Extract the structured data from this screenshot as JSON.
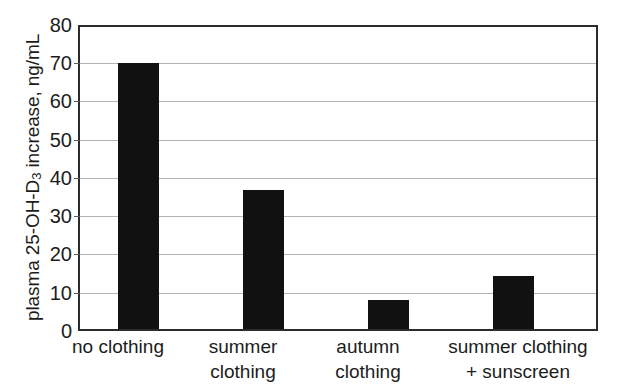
{
  "chart_data": {
    "type": "bar",
    "title": "",
    "xlabel": "",
    "ylabel": "plasma 25-OH-D3 increase, ng/mL",
    "ylabel_parts": {
      "pre": "plasma 25-OH-D",
      "sub": "3",
      "post": " increase, ng/mL"
    },
    "categories": [
      "no clothing",
      "summer clothing",
      "autumn clothing",
      "summer clothing + sunscreen"
    ],
    "category_lines": [
      [
        "no clothing"
      ],
      [
        "summer",
        "clothing"
      ],
      [
        "autumn",
        "clothing"
      ],
      [
        "summer clothing",
        "+ sunscreen"
      ]
    ],
    "values": [
      70,
      36.5,
      7.7,
      14
    ],
    "ylim": [
      0,
      80
    ],
    "ytick_step": 10,
    "yticks": [
      "80",
      "70",
      "60",
      "50",
      "40",
      "30",
      "20",
      "10",
      "0"
    ],
    "grid": true,
    "legend": false,
    "bar_color": "#111111",
    "grid_color": "#b4b4b4",
    "axis_color": "#2b2b2b"
  }
}
